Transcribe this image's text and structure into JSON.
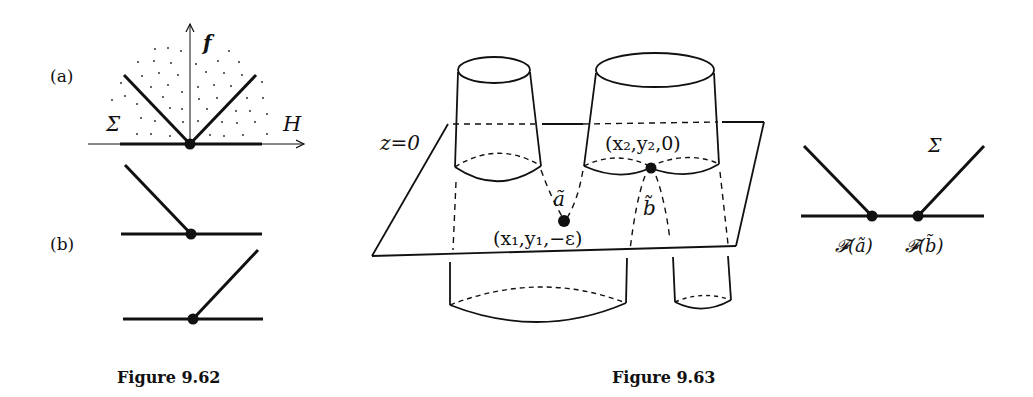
{
  "figures": [
    {
      "caption": "Figure 9.62",
      "panel_a": {
        "label": "(a)",
        "axis_vertical": "f",
        "axis_horizontal": "H",
        "region_label": "Σ"
      },
      "panel_b": {
        "label": "(b)"
      }
    },
    {
      "caption": "Figure 9.63",
      "plane_label": "z=0",
      "point_a_label": "ã",
      "point_b_label": "b̃",
      "point_a_coords": "(x₁,y₁,−ε)",
      "point_b_coords": "(x₂,y₂,0)",
      "inset": {
        "sigma_label": "Σ",
        "left_point_label": "𝓕(ã)",
        "right_point_label": "𝓕(b̃)"
      }
    }
  ],
  "colors": {
    "ink": "#111111",
    "background": "#ffffff"
  }
}
